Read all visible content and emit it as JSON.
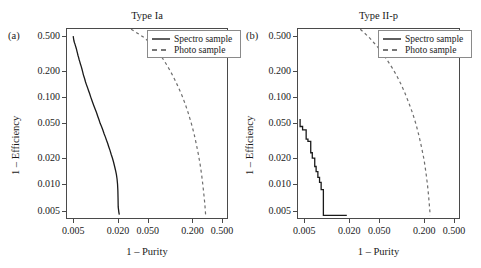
{
  "figure": {
    "panels": [
      {
        "letter": "(a)",
        "title": "Type Ia",
        "xlabel": "1 – Purity",
        "ylabel": "1 – Efficiency"
      },
      {
        "letter": "(b)",
        "title": "Type II-p",
        "xlabel": "1 – Purity",
        "ylabel": "1 – Efficiency"
      }
    ],
    "legend": {
      "entries": [
        {
          "label": "Spectro sample",
          "style": "solid"
        },
        {
          "label": "Photo sample",
          "style": "dashed"
        }
      ]
    },
    "ticks": {
      "x": [
        "0.005",
        "0.020",
        "0.050",
        "0.200",
        "0.500"
      ],
      "y": [
        "0.500",
        "0.200",
        "0.100",
        "0.050",
        "0.020",
        "0.010",
        "0.005"
      ]
    },
    "colors": {
      "spectro": "#1a1a1a",
      "photo": "#6e6e6e",
      "frame": "#4a4a4a",
      "background": "#ffffff"
    }
  },
  "chart_data": [
    {
      "type": "line",
      "title": "Type Ia",
      "panel": "(a)",
      "xlabel": "1 – Purity",
      "ylabel": "1 – Efficiency",
      "xscale": "log",
      "yscale": "log",
      "xlim": [
        0.004,
        0.6
      ],
      "ylim": [
        0.004,
        0.62
      ],
      "xticks": [
        0.005,
        0.02,
        0.05,
        0.2,
        0.5
      ],
      "yticks": [
        0.5,
        0.2,
        0.1,
        0.05,
        0.02,
        0.01,
        0.005
      ],
      "grid": false,
      "legend_position": "top-right",
      "series": [
        {
          "name": "Spectro sample",
          "style": "solid",
          "x": [
            0.005,
            0.00505,
            0.00512,
            0.0052,
            0.00528,
            0.00535,
            0.00545,
            0.00555,
            0.00562,
            0.0057,
            0.0058,
            0.0059,
            0.006,
            0.00612,
            0.00625,
            0.0064,
            0.00655,
            0.0067,
            0.00685,
            0.007,
            0.00715,
            0.0073,
            0.0075,
            0.00775,
            0.008,
            0.0083,
            0.0086,
            0.0089,
            0.0092,
            0.00955,
            0.0099,
            0.0103,
            0.0107,
            0.0111,
            0.0115,
            0.012,
            0.0125,
            0.013,
            0.0135,
            0.014,
            0.0145,
            0.015,
            0.0156,
            0.0162,
            0.0168,
            0.0174,
            0.018,
            0.0185,
            0.019,
            0.0194,
            0.0197,
            0.0199,
            0.02,
            0.0201,
            0.0205,
            0.0208
          ],
          "y": [
            0.5,
            0.47,
            0.44,
            0.42,
            0.405,
            0.39,
            0.37,
            0.35,
            0.335,
            0.32,
            0.3,
            0.285,
            0.27,
            0.255,
            0.24,
            0.225,
            0.21,
            0.195,
            0.18,
            0.17,
            0.16,
            0.15,
            0.14,
            0.13,
            0.12,
            0.11,
            0.1,
            0.092,
            0.085,
            0.078,
            0.072,
            0.066,
            0.06,
            0.055,
            0.05,
            0.046,
            0.042,
            0.038,
            0.035,
            0.032,
            0.0295,
            0.027,
            0.0245,
            0.022,
            0.02,
            0.018,
            0.016,
            0.0145,
            0.013,
            0.0115,
            0.01,
            0.0085,
            0.007,
            0.0055,
            0.0048,
            0.0045
          ]
        },
        {
          "name": "Photo sample",
          "style": "dashed",
          "x": [
            0.03,
            0.034,
            0.039,
            0.045,
            0.052,
            0.06,
            0.069,
            0.079,
            0.09,
            0.102,
            0.115,
            0.129,
            0.144,
            0.16,
            0.176,
            0.193,
            0.21,
            0.225,
            0.24,
            0.253,
            0.265,
            0.275,
            0.283,
            0.29,
            0.296,
            0.3
          ],
          "y": [
            0.6,
            0.56,
            0.52,
            0.48,
            0.43,
            0.38,
            0.33,
            0.28,
            0.235,
            0.195,
            0.16,
            0.13,
            0.105,
            0.083,
            0.065,
            0.05,
            0.038,
            0.029,
            0.022,
            0.017,
            0.013,
            0.01,
            0.008,
            0.0065,
            0.0053,
            0.0045
          ]
        }
      ]
    },
    {
      "type": "line",
      "title": "Type II-p",
      "panel": "(b)",
      "xlabel": "1 – Purity",
      "ylabel": "1 – Efficiency",
      "xscale": "log",
      "yscale": "log",
      "xlim": [
        0.004,
        0.6
      ],
      "ylim": [
        0.004,
        0.62
      ],
      "xticks": [
        0.005,
        0.02,
        0.05,
        0.2,
        0.5
      ],
      "yticks": [
        0.5,
        0.2,
        0.1,
        0.05,
        0.02,
        0.01,
        0.005
      ],
      "grid": false,
      "legend_position": "top-right",
      "series": [
        {
          "name": "Spectro sample",
          "style": "solid-step",
          "x": [
            0.0044,
            0.0044,
            0.00475,
            0.00475,
            0.0053,
            0.0053,
            0.0056,
            0.0056,
            0.0061,
            0.0061,
            0.0064,
            0.0064,
            0.0069,
            0.0069,
            0.0072,
            0.0072,
            0.0076,
            0.0076,
            0.008,
            0.008,
            0.0084,
            0.0084,
            0.009,
            0.009,
            0.014,
            0.0185
          ],
          "y": [
            0.056,
            0.046,
            0.046,
            0.042,
            0.042,
            0.033,
            0.033,
            0.031,
            0.031,
            0.023,
            0.023,
            0.02,
            0.02,
            0.016,
            0.016,
            0.014,
            0.014,
            0.012,
            0.012,
            0.0105,
            0.0105,
            0.0087,
            0.0087,
            0.0044,
            0.0044,
            0.0044
          ]
        },
        {
          "name": "Photo sample",
          "style": "dashed",
          "x": [
            0.028,
            0.032,
            0.037,
            0.0425,
            0.049,
            0.0565,
            0.065,
            0.075,
            0.086,
            0.098,
            0.111,
            0.125,
            0.14,
            0.155,
            0.17,
            0.185,
            0.199,
            0.211,
            0.221,
            0.229,
            0.235,
            0.24
          ],
          "y": [
            0.6,
            0.54,
            0.48,
            0.42,
            0.365,
            0.31,
            0.26,
            0.215,
            0.175,
            0.14,
            0.11,
            0.085,
            0.065,
            0.049,
            0.036,
            0.026,
            0.019,
            0.0135,
            0.0098,
            0.0072,
            0.0055,
            0.0044
          ]
        }
      ]
    }
  ]
}
